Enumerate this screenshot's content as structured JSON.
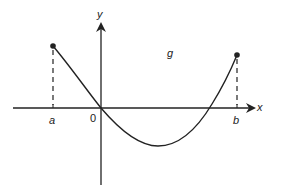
{
  "diagram": {
    "type": "function-graph",
    "function_label": "g",
    "axes": {
      "x_label": "x",
      "y_label": "y",
      "origin_label": "0"
    },
    "points": [
      {
        "label": "a",
        "description": "left endpoint, g(a) > 0, dashed vertical line to x-axis"
      },
      {
        "label": "b",
        "description": "right endpoint, g(b) > 0, dashed vertical line to x-axis"
      }
    ],
    "curve_description": "g decreases from (a, g(a)) through the origin to a minimum below the x-axis, then increases, crossing the x-axis before b and ending at (b, g(b))",
    "colors": {
      "line": "#222222",
      "background": "#ffffff"
    }
  }
}
